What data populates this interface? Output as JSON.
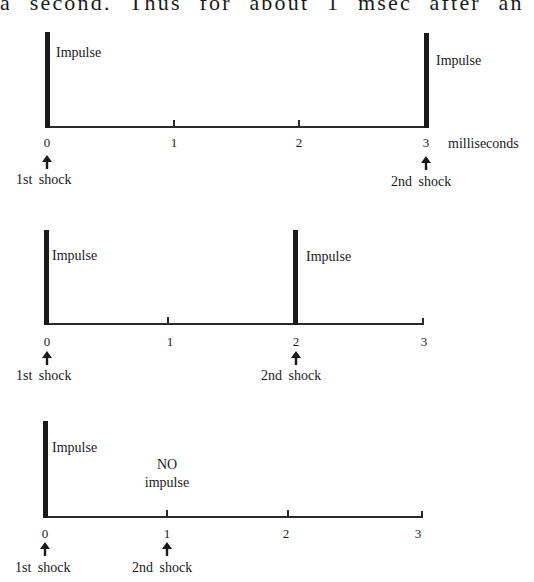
{
  "header_text": "a second. Thus for about 1 msec after an actio",
  "axis_unit": "milliseconds",
  "tick_labels": [
    "0",
    "1",
    "2",
    "3"
  ],
  "impulse_label": "Impulse",
  "no_impulse_label_line1": "NO",
  "no_impulse_label_line2": "impulse",
  "first_shock_label": "1st shock",
  "second_shock_label": "2nd shock",
  "panels": [
    {
      "name": "second-shock-at-3ms",
      "first_shock_ms": 0,
      "second_shock_ms": 3,
      "second_impulse": true
    },
    {
      "name": "second-shock-at-2ms",
      "first_shock_ms": 0,
      "second_shock_ms": 2,
      "second_impulse": true
    },
    {
      "name": "second-shock-at-1ms",
      "first_shock_ms": 0,
      "second_shock_ms": 1,
      "second_impulse": false
    }
  ]
}
